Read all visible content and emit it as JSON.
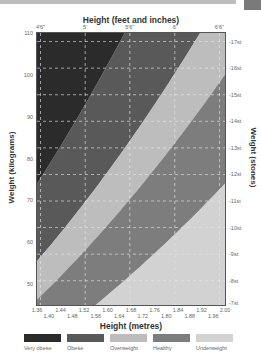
{
  "chart_data": {
    "type": "area",
    "xlabel_top": "Height (feet and inches)",
    "xlabel": "Height (metres)",
    "ylabel": "Weight (kilograms)",
    "ylabel_right": "Weight (stones)",
    "xlim": [
      1.36,
      2.0
    ],
    "ylim": [
      45,
      110
    ],
    "grid": true,
    "x_ticks_top": [
      "4'6\"",
      "5'",
      "5'6\"",
      "6'",
      "6'6\""
    ],
    "x_ticks_top_m": [
      1.372,
      1.524,
      1.676,
      1.829,
      1.981
    ],
    "x_ticks_bottom_upper": [
      "1.36",
      "1.44",
      "1.52",
      "1.60",
      "1.68",
      "1.76",
      "1.84",
      "1.92",
      "2.00"
    ],
    "x_ticks_bottom_lower": [
      "1.40",
      "1.48",
      "1.56",
      "1.64",
      "1.72",
      "1.80",
      "1.88",
      "1.96"
    ],
    "y_ticks": [
      110,
      100,
      90,
      80,
      70,
      60,
      50
    ],
    "y_ticks_right": [
      "17st",
      "16st",
      "15st",
      "14st",
      "13st",
      "12st",
      "11st",
      "10st",
      "9st",
      "8st",
      "7st"
    ],
    "y_ticks_right_kg": [
      107.95,
      101.6,
      95.25,
      88.9,
      82.55,
      76.2,
      69.85,
      63.5,
      57.15,
      50.8,
      44.45
    ],
    "bands": [
      {
        "name": "Very obese",
        "bmi_min": 40,
        "bmi_max": null,
        "color": "#2b2b2b"
      },
      {
        "name": "Obese",
        "bmi_min": 30,
        "bmi_max": 40,
        "color": "#595959"
      },
      {
        "name": "Overweight",
        "bmi_min": 25,
        "bmi_max": 30,
        "color": "#bdbdbd"
      },
      {
        "name": "Healthy",
        "bmi_min": 18.5,
        "bmi_max": 25,
        "color": "#7d7d7d"
      },
      {
        "name": "Underweight",
        "bmi_min": null,
        "bmi_max": 18.5,
        "color": "#d2d2d2"
      }
    ],
    "legend_position": "bottom"
  },
  "labels": {
    "title_top": "Height (feet and inches)",
    "title_bottom": "Height (metres)",
    "axis_left": "Weight (kilograms)",
    "axis_right": "Weight (stones)"
  },
  "legend": [
    {
      "label": "Very obese",
      "color": "#2b2b2b"
    },
    {
      "label": "Obese",
      "color": "#595959"
    },
    {
      "label": "Overweight",
      "color": "#bdbdbd"
    },
    {
      "label": "Healthy",
      "color": "#7d7d7d"
    },
    {
      "label": "Underweight",
      "color": "#d2d2d2"
    }
  ]
}
